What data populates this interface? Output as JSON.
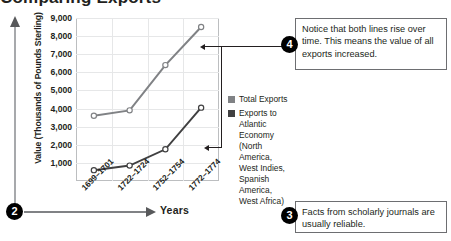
{
  "page": {
    "title_clipped": "Comparing Exports"
  },
  "chart_data": {
    "type": "line",
    "title": "",
    "xlabel": "Years",
    "ylabel": "Value (Thousands of Pounds Sterling)",
    "categories": [
      "1699–1701",
      "1722–1724",
      "1752–1754",
      "1772–1774"
    ],
    "ylim": [
      0,
      9000
    ],
    "yticks": [
      "1,000",
      "2,000",
      "3,000",
      "4,000",
      "5,000",
      "6,000",
      "7,000",
      "8,000",
      "9,000"
    ],
    "ytick_values": [
      1000,
      2000,
      3000,
      4000,
      5000,
      6000,
      7000,
      8000,
      9000
    ],
    "grid": true,
    "legend_position": "right",
    "series": [
      {
        "name": "Total Exports",
        "color": "#808285",
        "values": [
          3600,
          3900,
          6400,
          8500
        ]
      },
      {
        "name": "Exports to Atlantic Economy (North America, West Indies, Spanish America, West Africa)",
        "color": "#404041",
        "values": [
          600,
          850,
          1750,
          4050
        ]
      }
    ]
  },
  "legend": {
    "items": [
      {
        "label": "Total Exports",
        "color": "#808285"
      },
      {
        "label": "Exports to Atlantic Economy (North America, West Indies, Spanish America, West Africa)",
        "color": "#404041"
      }
    ]
  },
  "callouts": {
    "two": {
      "number": "2",
      "label": "Years"
    },
    "three": {
      "number": "3",
      "text": "Facts from scholarly journals are usually reliable."
    },
    "four": {
      "number": "4",
      "text": "Notice that both lines rise over time. This means the value of all exports increased."
    }
  }
}
